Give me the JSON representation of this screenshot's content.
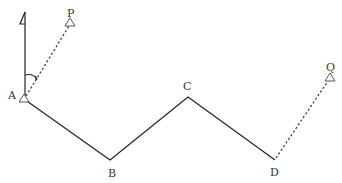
{
  "diagram": {
    "type": "traverse survey",
    "points": [
      {
        "id": "A",
        "label": "A",
        "x": 24,
        "y": 99,
        "marker": "triangle",
        "label_x": 13,
        "label_y": 99
      },
      {
        "id": "B",
        "label": "B",
        "x": 110,
        "y": 160,
        "label_x": 112,
        "label_y": 177
      },
      {
        "id": "C",
        "label": "C",
        "x": 188,
        "y": 97,
        "label_x": 187,
        "label_y": 90
      },
      {
        "id": "D",
        "label": "D",
        "x": 275,
        "y": 160,
        "label_x": 274,
        "label_y": 176
      },
      {
        "id": "P",
        "label": "P",
        "x": 70,
        "y": 23,
        "marker": "triangle",
        "label_x": 71,
        "label_y": 18
      },
      {
        "id": "Q",
        "label": "Q",
        "x": 330,
        "y": 78,
        "marker": "triangle",
        "label_x": 330,
        "label_y": 71
      }
    ],
    "solid_lines": [
      [
        "A",
        "B"
      ],
      [
        "B",
        "C"
      ],
      [
        "C",
        "D"
      ]
    ],
    "dashed_lines": [
      [
        "A",
        "P"
      ],
      [
        "D",
        "Q"
      ]
    ],
    "north_arrow": {
      "x": 25,
      "y_top": 10,
      "y_bottom": 97
    },
    "angle_arc": {
      "center": "A",
      "from": "north",
      "to": "P"
    },
    "colors": {
      "line": "#222222",
      "label": "#333333",
      "background": "#ffffff"
    }
  }
}
